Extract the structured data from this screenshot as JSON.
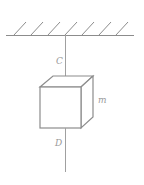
{
  "diagram": {
    "labels": {
      "upper_string": "C",
      "lower_string": "D",
      "mass": "m"
    },
    "colors": {
      "line": "#8c8c8c",
      "label": "#9a9a9a",
      "background": "#ffffff"
    },
    "ceiling": {
      "hatch_count": 7
    }
  }
}
